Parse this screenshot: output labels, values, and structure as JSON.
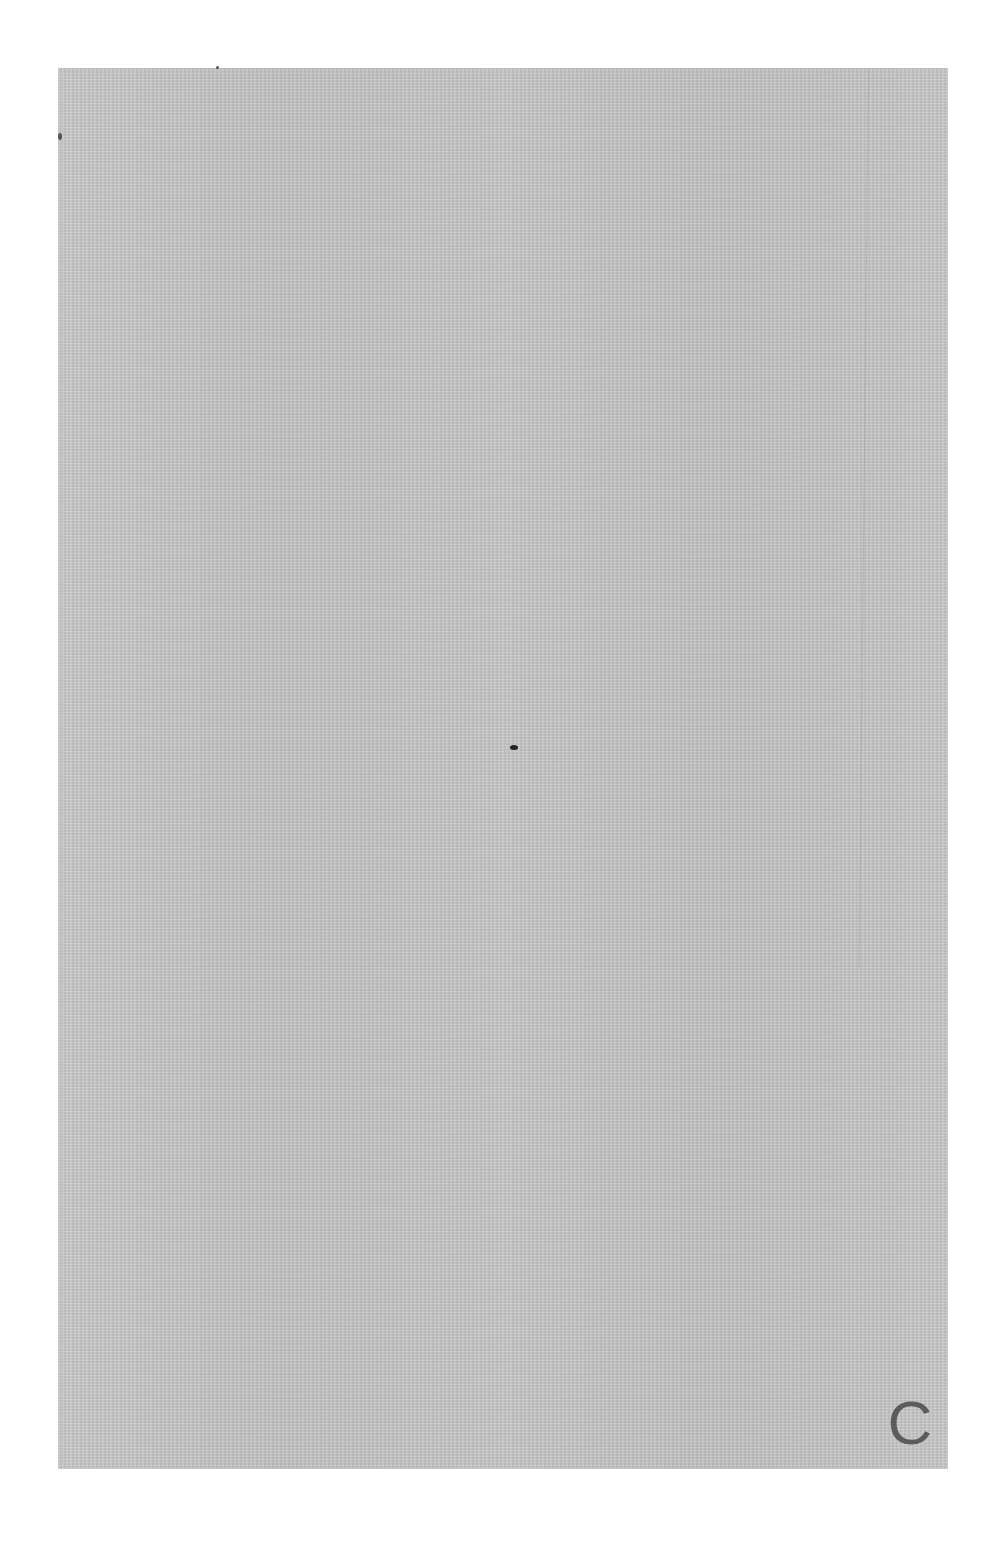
{
  "document": {
    "type": "scanned blank page",
    "page_color": "#c6c6c6",
    "background_color": "#ffffff",
    "corner_mark": "C"
  }
}
